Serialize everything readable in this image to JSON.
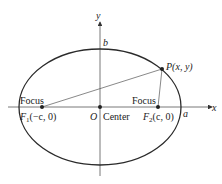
{
  "diagram": {
    "type": "ellipse-with-foci",
    "axes": {
      "x_label": "x",
      "y_label": "y"
    },
    "labels": {
      "b": "b",
      "a": "a",
      "origin": "O",
      "center": "Center",
      "focus_left": "Focus",
      "focus_right": "Focus",
      "f1_name": "F",
      "f1_sub": "1",
      "f1_coords": "(−c, 0)",
      "f2_name": "F",
      "f2_sub": "2",
      "f2_coords": "(c, 0)",
      "point": "P(x, y)"
    },
    "colors": {
      "ellipse": "#2a2a2a",
      "axes": "#555555",
      "lines": "#555555",
      "text": "#222222"
    }
  }
}
